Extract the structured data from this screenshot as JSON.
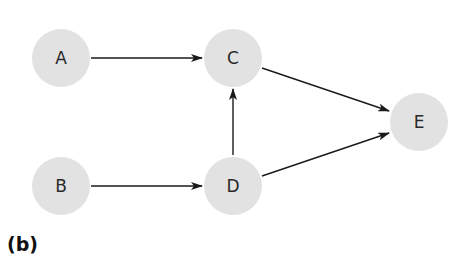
{
  "diagram": {
    "type": "directed-graph",
    "node_fill": "#e2e2e2",
    "edge_color": "#1a1a1a",
    "nodes": [
      {
        "id": "A",
        "label": "A",
        "cx": 61,
        "cy": 58
      },
      {
        "id": "B",
        "label": "B",
        "cx": 61,
        "cy": 186
      },
      {
        "id": "C",
        "label": "C",
        "cx": 233,
        "cy": 58
      },
      {
        "id": "D",
        "label": "D",
        "cx": 233,
        "cy": 186
      },
      {
        "id": "E",
        "label": "E",
        "cx": 419,
        "cy": 122
      }
    ],
    "edges": [
      {
        "from": "A",
        "to": "C"
      },
      {
        "from": "B",
        "to": "D"
      },
      {
        "from": "D",
        "to": "C"
      },
      {
        "from": "C",
        "to": "E"
      },
      {
        "from": "D",
        "to": "E"
      }
    ]
  },
  "caption": "(b)"
}
